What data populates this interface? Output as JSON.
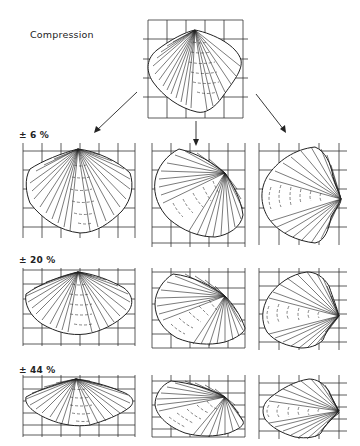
{
  "figure": {
    "title": "Compression",
    "original_shell": {
      "description": "Undeformed brachiopod shell on square reference grid",
      "grid": {
        "columns": 5,
        "rows": 5
      }
    },
    "directions": [
      {
        "id": "oblique-left",
        "arrow": "down-left"
      },
      {
        "id": "vertical",
        "arrow": "down"
      },
      {
        "id": "oblique-right",
        "arrow": "down-right"
      }
    ],
    "rows": [
      {
        "label": "± 6 %",
        "strain": "6%"
      },
      {
        "label": "± 20 %",
        "strain": "20%"
      },
      {
        "label": "± 44 %",
        "strain": "44%"
      }
    ],
    "colors": {
      "ink": "#222222",
      "background": "#ffffff"
    }
  }
}
